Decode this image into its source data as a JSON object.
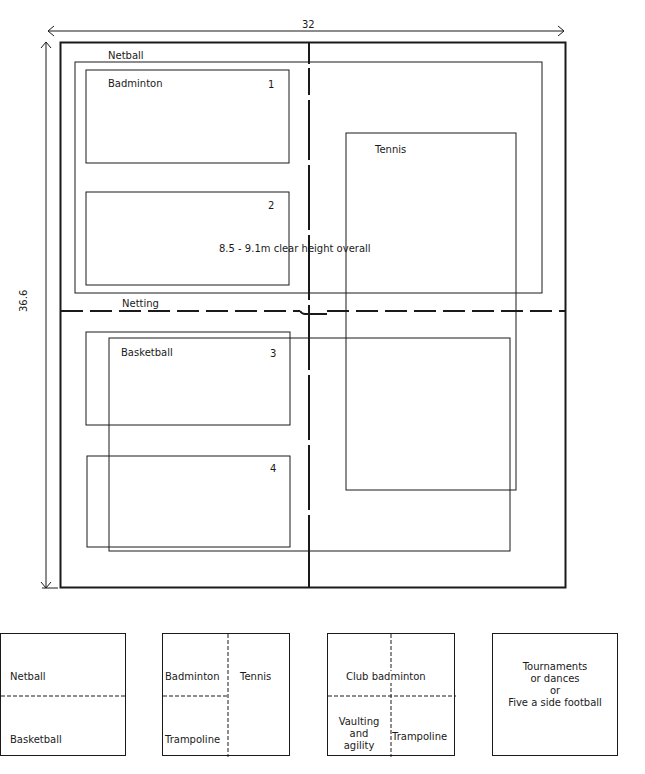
{
  "plan": {
    "width_dimension": "32",
    "height_dimension": "36.6",
    "labels": {
      "netball": "Netball",
      "badminton": "Badminton",
      "court_1": "1",
      "court_2": "2",
      "court_3": "3",
      "court_4": "4",
      "tennis": "Tennis",
      "clear_height": "8.5 - 9.1m  clear height overall",
      "netting": "Netting",
      "basketball": "Basketball"
    }
  },
  "layouts": [
    {
      "name": "netball-basketball",
      "top": "Netball",
      "bottom": "Basketball"
    },
    {
      "name": "badminton-tennis-trampoline",
      "top_left": "Badminton",
      "right": "Tennis",
      "bottom_left": "Trampoline"
    },
    {
      "name": "club-badminton-vaulting-trampoline",
      "top": "Club badminton",
      "bottom_left_lines": [
        "Vaulting",
        "and",
        "agility"
      ],
      "bottom_right": "Trampoline"
    },
    {
      "name": "tournaments",
      "lines": [
        "Tournaments",
        "or  dances",
        "or",
        "Five a side football"
      ]
    }
  ],
  "colors": {
    "line": "#1a1a1a",
    "background": "#ffffff"
  }
}
